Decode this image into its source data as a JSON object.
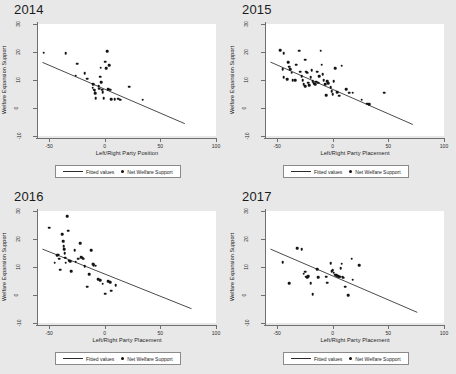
{
  "figure": {
    "background_color": "#e8e8e8",
    "plot_background_color": "#ffffff",
    "marker_color": "#141414",
    "line_color": "#2b2b2b",
    "axis_color": "#6f6f6f"
  },
  "legend": {
    "fitted_label": "Fitted values",
    "points_label": "Net Welfare Support"
  },
  "axes": {
    "ylabel": "Welfare Expansion Support",
    "yticks": [
      "30",
      "20",
      "10",
      "0",
      "-10"
    ],
    "ytick_values": [
      30,
      20,
      10,
      0,
      -10
    ],
    "xticks": [
      "-50",
      "0",
      "50",
      "100"
    ],
    "xtick_values": [
      -50,
      0,
      50,
      100
    ],
    "xlim": [
      -60,
      100
    ],
    "ylim": [
      -10,
      30
    ]
  },
  "chart_data": [
    {
      "type": "scatter",
      "title": "2014",
      "xlabel": "Left/Right Party Position",
      "ylabel": "Welfare Expansion Support",
      "xlim": [
        -60,
        100
      ],
      "ylim": [
        -10,
        30
      ],
      "xticks": [
        -50,
        0,
        50,
        100
      ],
      "yticks": [
        -10,
        0,
        10,
        20,
        30
      ],
      "grid": false,
      "legend_position": "below-axes",
      "series": [
        {
          "name": "Net Welfare Support",
          "points": [
            [
              -55.0,
              19.8
            ],
            [
              -35.0,
              19.6
            ],
            [
              -25.0,
              15.8
            ],
            [
              -26.0,
              11.5
            ],
            [
              -18.0,
              12.5
            ],
            [
              -16.0,
              10.4
            ],
            [
              -10.5,
              8.6
            ],
            [
              -11.0,
              7.2
            ],
            [
              -10.0,
              6.6
            ],
            [
              -9.0,
              6.3
            ],
            [
              -8.5,
              5.2
            ],
            [
              -8.0,
              3.6
            ],
            [
              -5.5,
              7.8
            ],
            [
              -5.0,
              6.9
            ],
            [
              -4.0,
              11.2
            ],
            [
              -3.5,
              14.4
            ],
            [
              -3.0,
              9.3
            ],
            [
              -2.5,
              6.6
            ],
            [
              -2.0,
              5.6
            ],
            [
              -1.0,
              3.5
            ],
            [
              0.5,
              16.6
            ],
            [
              1.5,
              14.2
            ],
            [
              2.0,
              20.3
            ],
            [
              3.0,
              6.7
            ],
            [
              4.0,
              15.2
            ],
            [
              5.0,
              6.5
            ],
            [
              6.0,
              3.1
            ],
            [
              9.0,
              3.2
            ],
            [
              12.0,
              3.3
            ],
            [
              14.0,
              2.9
            ],
            [
              22.0,
              7.6
            ],
            [
              34.0,
              3.0
            ]
          ]
        },
        {
          "name": "Fitted values",
          "type": "line",
          "endpoints": [
            [
              -56.0,
              16.3
            ],
            [
              72.0,
              -5.6
            ]
          ],
          "slope": -0.171,
          "intercept": 6.72
        }
      ]
    },
    {
      "type": "scatter",
      "title": "2015",
      "xlabel": "Left/Right Party Placement",
      "ylabel": "Welfare Expansion Support",
      "xlim": [
        -60,
        100
      ],
      "ylim": [
        -10,
        30
      ],
      "xticks": [
        -50,
        0,
        50,
        100
      ],
      "yticks": [
        -10,
        0,
        10,
        20,
        30
      ],
      "grid": false,
      "legend_position": "below-axes",
      "series": [
        {
          "name": "Net Welfare Support",
          "points": [
            [
              -47.0,
              20.6
            ],
            [
              -44.0,
              19.6
            ],
            [
              -45.0,
              13.8
            ],
            [
              -44.0,
              11.0
            ],
            [
              -41.0,
              10.2
            ],
            [
              -40.0,
              16.3
            ],
            [
              -39.0,
              14.8
            ],
            [
              -38.0,
              13.9
            ],
            [
              -37.0,
              12.6
            ],
            [
              -36.0,
              10.0
            ],
            [
              -34.0,
              9.9
            ],
            [
              -33.0,
              15.5
            ],
            [
              -30.0,
              20.4
            ],
            [
              -29.0,
              13.0
            ],
            [
              -28.0,
              11.4
            ],
            [
              -27.0,
              10.0
            ],
            [
              -26.0,
              8.6
            ],
            [
              -25.0,
              7.8
            ],
            [
              -24.5,
              17.3
            ],
            [
              -24.0,
              12.9
            ],
            [
              -23.0,
              12.6
            ],
            [
              -22.0,
              9.0
            ],
            [
              -21.0,
              8.2
            ],
            [
              -20.0,
              11.0
            ],
            [
              -19.0,
              13.4
            ],
            [
              -18.0,
              9.6
            ],
            [
              -17.0,
              8.9
            ],
            [
              -16.0,
              8.5
            ],
            [
              -15.0,
              9.4
            ],
            [
              -14.0,
              13.0
            ],
            [
              -13.0,
              9.0
            ],
            [
              -12.0,
              11.3
            ],
            [
              -11.0,
              20.5
            ],
            [
              -10.0,
              15.4
            ],
            [
              -9.0,
              12.0
            ],
            [
              -8.0,
              9.9
            ],
            [
              -7.0,
              8.5
            ],
            [
              -6.0,
              4.6
            ],
            [
              -5.0,
              9.6
            ],
            [
              -4.0,
              8.8
            ],
            [
              -2.0,
              7.5
            ],
            [
              -1.0,
              6.1
            ],
            [
              0.0,
              5.0
            ],
            [
              1.0,
              9.6
            ],
            [
              2.0,
              14.2
            ],
            [
              4.0,
              5.6
            ],
            [
              6.0,
              4.4
            ],
            [
              8.0,
              15.1
            ],
            [
              12.0,
              6.8
            ],
            [
              15.0,
              5.5
            ],
            [
              18.0,
              5.4
            ],
            [
              26.0,
              2.9
            ],
            [
              31.0,
              1.6
            ],
            [
              33.0,
              1.4
            ],
            [
              46.0,
              5.5
            ]
          ]
        },
        {
          "name": "Fitted values",
          "type": "line",
          "endpoints": [
            [
              -56.0,
              16.4
            ],
            [
              72.0,
              -5.9
            ]
          ],
          "slope": -0.174,
          "intercept": 6.66
        }
      ]
    },
    {
      "type": "scatter",
      "title": "2016",
      "xlabel": "Left/Right Party Placement",
      "ylabel": "Welfare Expansion Support",
      "xlim": [
        -60,
        100
      ],
      "ylim": [
        -10,
        30
      ],
      "xticks": [
        -50,
        0,
        50,
        100
      ],
      "yticks": [
        -10,
        0,
        10,
        20,
        30
      ],
      "grid": false,
      "legend_position": "below-axes",
      "series": [
        {
          "name": "Net Welfare Support",
          "points": [
            [
              -50.0,
              24.0
            ],
            [
              -45.0,
              11.6
            ],
            [
              -43.0,
              14.3
            ],
            [
              -42.0,
              14.4
            ],
            [
              -41.0,
              13.0
            ],
            [
              -40.0,
              9.0
            ],
            [
              -38.0,
              21.8
            ],
            [
              -37.5,
              19.3
            ],
            [
              -37.0,
              17.5
            ],
            [
              -36.5,
              16.4
            ],
            [
              -36.0,
              14.9
            ],
            [
              -35.5,
              13.3
            ],
            [
              -35.0,
              11.6
            ],
            [
              -34.0,
              28.2
            ],
            [
              -33.0,
              23.0
            ],
            [
              -32.0,
              12.3
            ],
            [
              -31.0,
              12.1
            ],
            [
              -30.0,
              8.6
            ],
            [
              -27.0,
              15.9
            ],
            [
              -26.0,
              11.9
            ],
            [
              -24.0,
              13.0
            ],
            [
              -22.0,
              18.6
            ],
            [
              -21.0,
              13.6
            ],
            [
              -20.0,
              13.1
            ],
            [
              -19.0,
              12.9
            ],
            [
              -18.0,
              10.2
            ],
            [
              -16.0,
              3.0
            ],
            [
              -14.0,
              7.5
            ],
            [
              -12.0,
              16.0
            ],
            [
              -11.0,
              11.2
            ],
            [
              -10.5,
              11.0
            ],
            [
              -10.0,
              10.7
            ],
            [
              -8.0,
              10.4
            ],
            [
              -6.0,
              5.6
            ],
            [
              -4.0,
              5.2
            ],
            [
              -2.0,
              4.0
            ],
            [
              0.5,
              0.4
            ],
            [
              3.0,
              5.0
            ],
            [
              5.0,
              4.6
            ],
            [
              6.0,
              1.6
            ],
            [
              10.0,
              3.5
            ]
          ]
        },
        {
          "name": "Fitted values",
          "type": "line",
          "endpoints": [
            [
              -56.0,
              16.4
            ],
            [
              78.0,
              -4.9
            ]
          ],
          "slope": -0.159,
          "intercept": 7.5
        }
      ]
    },
    {
      "type": "scatter",
      "title": "2017",
      "xlabel": "Left/Right Party Placement",
      "ylabel": "Welfare Expansion Support",
      "xlim": [
        -60,
        100
      ],
      "ylim": [
        -10,
        30
      ],
      "xticks": [
        -50,
        0,
        50,
        100
      ],
      "yticks": [
        -10,
        0,
        10,
        20,
        30
      ],
      "grid": false,
      "legend_position": "below-axes",
      "series": [
        {
          "name": "Net Welfare Support",
          "points": [
            [
              -33.0,
              30.6
            ],
            [
              -45.0,
              11.8
            ],
            [
              -39.0,
              4.2
            ],
            [
              -32.0,
              16.8
            ],
            [
              -28.0,
              16.4
            ],
            [
              -26.0,
              7.6
            ],
            [
              -25.0,
              8.3
            ],
            [
              -24.0,
              6.6
            ],
            [
              -23.0,
              6.4
            ],
            [
              -22.0,
              6.8
            ],
            [
              -20.0,
              4.2
            ],
            [
              -18.0,
              0.2
            ],
            [
              -14.0,
              9.3
            ],
            [
              -13.0,
              6.4
            ],
            [
              -6.0,
              6.5
            ],
            [
              -5.0,
              4.4
            ],
            [
              -2.0,
              11.3
            ],
            [
              -1.0,
              8.4
            ],
            [
              0.0,
              8.9
            ],
            [
              1.0,
              7.9
            ],
            [
              2.0,
              7.2
            ],
            [
              3.0,
              7.0
            ],
            [
              4.0,
              6.9
            ],
            [
              5.0,
              6.8
            ],
            [
              6.0,
              6.6
            ],
            [
              6.5,
              6.5
            ],
            [
              7.0,
              9.6
            ],
            [
              8.0,
              11.2
            ],
            [
              9.0,
              6.4
            ],
            [
              10.0,
              6.2
            ],
            [
              11.0,
              3.0
            ],
            [
              14.0,
              0.0
            ],
            [
              17.0,
              13.0
            ],
            [
              18.0,
              5.4
            ],
            [
              24.0,
              10.6
            ]
          ]
        },
        {
          "name": "Fitted values",
          "type": "line",
          "endpoints": [
            [
              -56.0,
              16.4
            ],
            [
              76.0,
              -6.2
            ]
          ],
          "slope": -0.171,
          "intercept": 6.8
        }
      ]
    }
  ]
}
